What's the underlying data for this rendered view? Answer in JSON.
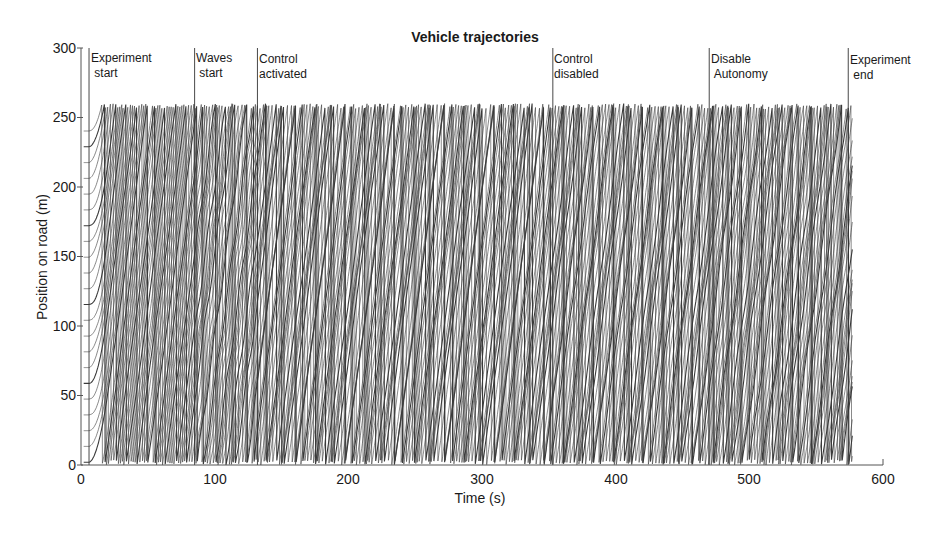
{
  "chart_data": {
    "type": "line",
    "title": "Vehicle trajectories",
    "xlabel": "Time (s)",
    "ylabel": "Position on road (m)",
    "xlim": [
      0,
      600
    ],
    "ylim": [
      0,
      300
    ],
    "xticks": [
      0,
      100,
      200,
      300,
      400,
      500,
      600
    ],
    "yticks": [
      0,
      50,
      100,
      150,
      200,
      250,
      300
    ],
    "grid": false,
    "legend": null,
    "road_length_m": 260,
    "data_time_range_s": [
      2,
      577
    ],
    "approx_vehicle_count": 22,
    "approx_mean_speed_mps": 7,
    "annotations": [
      {
        "t": 6,
        "label_line1": "Experiment",
        "label_line2": " start"
      },
      {
        "t": 85,
        "label_line1": "Waves",
        "label_line2": " start"
      },
      {
        "t": 132,
        "label_line1": "Control",
        "label_line2": "activated"
      },
      {
        "t": 353,
        "label_line1": "Control",
        "label_line2": "disabled"
      },
      {
        "t": 470,
        "label_line1": "Disable",
        "label_line2": " Autonomy"
      },
      {
        "t": 574,
        "label_line1": "Experiment",
        "label_line2": " end"
      }
    ],
    "line_color": "#3a3a3a"
  }
}
